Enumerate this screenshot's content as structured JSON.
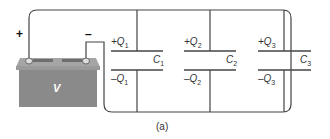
{
  "diagram": {
    "type": "circuit",
    "battery": {
      "label": "V",
      "positive_sign": "+",
      "negative_sign": "–"
    },
    "capacitors": [
      {
        "name": "C",
        "index": "1",
        "top_charge": "+Q",
        "bottom_charge": "–Q"
      },
      {
        "name": "C",
        "index": "2",
        "top_charge": "+Q",
        "bottom_charge": "–Q"
      },
      {
        "name": "C",
        "index": "3",
        "top_charge": "+Q",
        "bottom_charge": "–Q"
      }
    ],
    "caption": "(a)"
  },
  "colors": {
    "wire": "#444444",
    "battery_body": "#8a8a8a",
    "battery_top": "#a0a0a0"
  }
}
